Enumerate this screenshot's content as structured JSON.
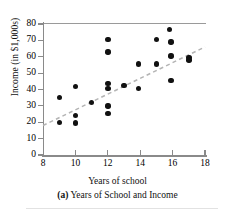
{
  "figure": {
    "label": "(a)",
    "caption": "(a) Years of School and Income",
    "caption_prefix": "(a)",
    "caption_text": "Years of School and Income",
    "xlabel": "Years of school",
    "ylabel": "Income (in $1,000s)"
  },
  "colors": {
    "point": "#111111",
    "axis": "#8a8a8a",
    "trendline": "#b4b4b4",
    "background": "#ffffff"
  },
  "chart_data": {
    "type": "scatter",
    "title": "(a) Years of School and Income",
    "xlabel": "Years of school",
    "ylabel": "Income (in $1,000s)",
    "xlim": [
      8,
      18
    ],
    "ylim": [
      0,
      80
    ],
    "xticks": [
      8,
      10,
      12,
      14,
      16,
      18
    ],
    "yticks": [
      0,
      10,
      20,
      30,
      40,
      50,
      60,
      70,
      80
    ],
    "xtick_labels": [
      "8",
      "10",
      "12",
      "14",
      "16",
      "18"
    ],
    "ytick_labels": [
      "0",
      "10",
      "20",
      "30",
      "40",
      "50",
      "60",
      "70",
      "80"
    ],
    "grid": false,
    "legend": null,
    "points": [
      {
        "x": 9.0,
        "y": 35.0
      },
      {
        "x": 9.0,
        "y": 20.0
      },
      {
        "x": 10.0,
        "y": 42.0
      },
      {
        "x": 10.0,
        "y": 24.0
      },
      {
        "x": 10.0,
        "y": 19.5
      },
      {
        "x": 11.0,
        "y": 32.0
      },
      {
        "x": 12.0,
        "y": 70.5
      },
      {
        "x": 12.0,
        "y": 63.0
      },
      {
        "x": 12.0,
        "y": 43.5
      },
      {
        "x": 12.0,
        "y": 40.5
      },
      {
        "x": 12.0,
        "y": 30.0
      },
      {
        "x": 12.0,
        "y": 25.5
      },
      {
        "x": 13.0,
        "y": 42.5
      },
      {
        "x": 13.9,
        "y": 55.5
      },
      {
        "x": 13.9,
        "y": 40.5
      },
      {
        "x": 15.0,
        "y": 70.5
      },
      {
        "x": 15.0,
        "y": 55.5
      },
      {
        "x": 15.8,
        "y": 76.5
      },
      {
        "x": 15.9,
        "y": 69.0
      },
      {
        "x": 15.9,
        "y": 60.5
      },
      {
        "x": 15.9,
        "y": 45.5
      },
      {
        "x": 17.0,
        "y": 59.5
      },
      {
        "x": 17.0,
        "y": 58.0
      }
    ],
    "trendline": {
      "style": "dashed",
      "x0": 8.0,
      "y0": 18.0,
      "x1": 18.0,
      "y1": 66.0
    }
  }
}
